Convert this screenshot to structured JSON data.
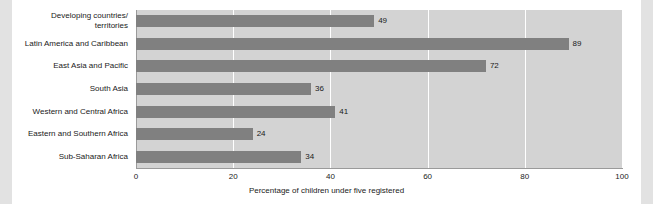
{
  "chart_data": {
    "type": "bar",
    "orientation": "horizontal",
    "title": "",
    "xlabel": "Percentage of children under five registered",
    "ylabel": "",
    "xlim": [
      0,
      100
    ],
    "xticks": [
      0,
      20,
      40,
      60,
      80,
      100
    ],
    "grid": true,
    "legend": null,
    "categories": [
      "Developing countries/\nterritories",
      "Latin America and Caribbean",
      "East Asia and Pacific",
      "South Asia",
      "Western and Central Africa",
      "Eastern and Southern Africa",
      "Sub-Saharan Africa"
    ],
    "values": [
      49,
      89,
      72,
      36,
      41,
      24,
      34
    ],
    "value_labels": [
      "49",
      "89",
      "72",
      "36",
      "41",
      "24",
      "34"
    ]
  },
  "colors": {
    "bar": "#808080",
    "plot_background": "#d3d3d3",
    "gridline": "#ffffff",
    "axis": "#9a9a9a",
    "page_background": "#ffffff",
    "edge_band": "#e2e2e2",
    "text": "#1a1a1a"
  }
}
